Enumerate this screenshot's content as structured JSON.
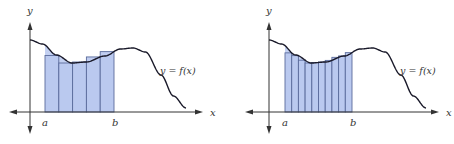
{
  "colors": {
    "fill": "#b9c8ee",
    "rect_stroke": "#5b6c9c",
    "curve": "#1a1a2a",
    "curve_inside": "#2c3f8a",
    "axis": "#333333"
  },
  "panels": [
    {
      "id": "left",
      "rect_count": 5,
      "labels": {
        "y": "y",
        "x": "x",
        "a": "a",
        "b": "b",
        "func": "y = f(x)"
      }
    },
    {
      "id": "right",
      "rect_count": 10,
      "labels": {
        "y": "y",
        "x": "x",
        "a": "a",
        "b": "b",
        "func": "y = f(x)"
      }
    }
  ]
}
